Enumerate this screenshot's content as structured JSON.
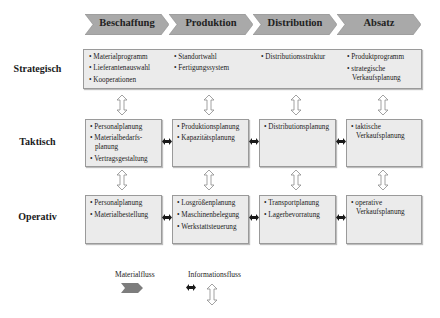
{
  "header": {
    "stages": [
      {
        "label": "Beschaffung"
      },
      {
        "label": "Produktion"
      },
      {
        "label": "Distribution"
      },
      {
        "label": "Absatz"
      }
    ]
  },
  "rows": {
    "strategisch": {
      "label": "Strategisch",
      "cols": [
        [
          "Materialprogramm",
          "Lieferantenauswahl",
          "Kooperationen"
        ],
        [
          "Standortwahl",
          "Fertigungssystem"
        ],
        [
          "Distributionsstruktur"
        ],
        [
          "Produktprogramm",
          "strategische",
          "Verkaufsplanung"
        ]
      ]
    },
    "taktisch": {
      "label": "Taktisch",
      "cols": [
        [
          "Personalplanung",
          "Materialbedarfs-",
          "planung",
          "Vertragsgestaltung"
        ],
        [
          "Produktionsplanung",
          "Kapazitätsplanung"
        ],
        [
          "Distributionsplanung"
        ],
        [
          "taktische",
          "Verkaufsplanung"
        ]
      ]
    },
    "operativ": {
      "label": "Operativ",
      "cols": [
        [
          "Personalplanung",
          "Materialbestellung"
        ],
        [
          "Losgrößenplanung",
          "Maschinenbelegung",
          "Werkstattsteuerung"
        ],
        [
          "Transportplanung",
          "Lagerbevorratung"
        ],
        [
          "operative",
          "Verkaufsplanung"
        ]
      ]
    }
  },
  "legend": {
    "material_label": "Materialfluss",
    "info_label": "Informationsfluss"
  },
  "colors": {
    "chevron_fill": "#a9a9a9",
    "box_fill": "#ebebeb",
    "box_border": "#9a9a9a",
    "arrow_dark": "#1a1a1a"
  },
  "bullet": "•"
}
